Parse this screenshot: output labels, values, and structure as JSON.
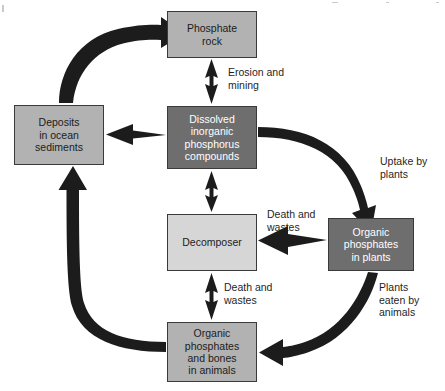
{
  "diagram": {
    "colors": {
      "background": "#ffffff",
      "box_medium": "#b2b2b2",
      "box_dark": "#6e6e6e",
      "box_light": "#d6d6d6",
      "box_border": "#3a3a3a",
      "arrow": "#1c1c1c",
      "text_dark": "#1c1c1c",
      "text_light": "#ffffff"
    },
    "nodes": [
      {
        "id": "phosphate-rock",
        "label": "Phosphate\nrock",
        "style": "medium",
        "x": 167,
        "y": 11,
        "w": 90,
        "h": 47
      },
      {
        "id": "deposits-ocean-sediments",
        "label": "Deposits\nin ocean\nsediments",
        "style": "medium",
        "x": 14,
        "y": 105,
        "w": 90,
        "h": 60
      },
      {
        "id": "dissolved-inorganic-phosphorus",
        "label": "Dissolved\ninorganic\nphosphorus\ncompounds",
        "style": "dark",
        "x": 167,
        "y": 106,
        "w": 90,
        "h": 63
      },
      {
        "id": "decomposer",
        "label": "Decomposer",
        "style": "light",
        "x": 167,
        "y": 214,
        "w": 90,
        "h": 57
      },
      {
        "id": "organic-phosphates-in-plants",
        "label": "Organic\nphosphates\nin plants",
        "style": "dark",
        "x": 328,
        "y": 218,
        "w": 86,
        "h": 53
      },
      {
        "id": "organic-phosphates-bones-in-animals",
        "label": "Organic\nphosphates\nand bones\nin animals",
        "style": "medium",
        "x": 167,
        "y": 322,
        "w": 90,
        "h": 60
      }
    ],
    "edge_labels": [
      {
        "id": "erosion-and-mining",
        "text": "Erosion and\nmining",
        "x": 228,
        "y": 66
      },
      {
        "id": "uptake-by-plants",
        "text": "Uptake by\nplants",
        "x": 380,
        "y": 155
      },
      {
        "id": "death-and-wastes-plants",
        "text": "Death and\nwastes",
        "x": 267,
        "y": 208
      },
      {
        "id": "death-and-wastes-animals",
        "text": "Death and\nwastes",
        "x": 224,
        "y": 281
      },
      {
        "id": "plants-eaten-by-animals",
        "text": "Plants\neaten by\nanimals",
        "x": 379,
        "y": 281
      }
    ],
    "edges": [
      {
        "id": "deposits-to-phosphate-rock",
        "kind": "thick-curve",
        "from": "deposits-ocean-sediments",
        "to": "phosphate-rock"
      },
      {
        "id": "phosphate-rock-to-dissolved",
        "kind": "double-arrow-vertical",
        "from": "phosphate-rock",
        "to": "dissolved-inorganic-phosphorus"
      },
      {
        "id": "dissolved-to-deposits",
        "kind": "single-arrow-left",
        "from": "dissolved-inorganic-phosphorus",
        "to": "deposits-ocean-sediments"
      },
      {
        "id": "dissolved-to-decomposer",
        "kind": "double-arrow-vertical",
        "from": "dissolved-inorganic-phosphorus",
        "to": "decomposer"
      },
      {
        "id": "dissolved-to-plants",
        "kind": "thick-curve",
        "from": "dissolved-inorganic-phosphorus",
        "to": "organic-phosphates-in-plants"
      },
      {
        "id": "plants-to-decomposer",
        "kind": "single-arrow-left",
        "from": "organic-phosphates-in-plants",
        "to": "decomposer"
      },
      {
        "id": "plants-to-animals",
        "kind": "thick-curve",
        "from": "organic-phosphates-in-plants",
        "to": "organic-phosphates-bones-in-animals"
      },
      {
        "id": "animals-to-decomposer",
        "kind": "double-arrow-vertical",
        "from": "organic-phosphates-bones-in-animals",
        "to": "decomposer"
      },
      {
        "id": "animals-to-deposits",
        "kind": "thick-curve",
        "from": "organic-phosphates-bones-in-animals",
        "to": "deposits-ocean-sediments"
      }
    ]
  }
}
